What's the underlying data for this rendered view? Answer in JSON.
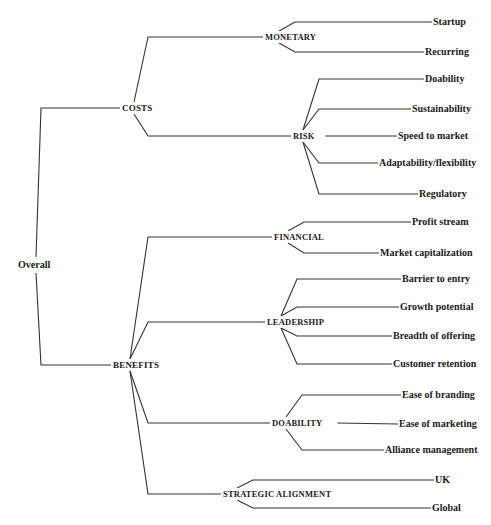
{
  "diagram": {
    "type": "hierarchy-tree",
    "line_color": "#333333",
    "root": {
      "label": "Overall",
      "x": 18,
      "y": 265,
      "children": [
        {
          "label": "COSTS",
          "x": 122,
          "y": 108,
          "children": [
            {
              "label": "MONETARY",
              "x": 265,
              "y": 37,
              "children": [
                {
                  "label": "Startup",
                  "x": 433,
                  "y": 22
                },
                {
                  "label": "Recurring",
                  "x": 425,
                  "y": 52
                }
              ]
            },
            {
              "label": "RISK",
              "x": 293,
              "y": 136,
              "children": [
                {
                  "label": "Doability",
                  "x": 425,
                  "y": 79
                },
                {
                  "label": "Sustainability",
                  "x": 412,
                  "y": 109
                },
                {
                  "label": "Speed to market",
                  "x": 398,
                  "y": 136
                },
                {
                  "label": "Adaptability/flexibility",
                  "x": 379,
                  "y": 163
                },
                {
                  "label": "Regulatory",
                  "x": 419,
                  "y": 194
                }
              ]
            }
          ]
        },
        {
          "label": "BENEFITS",
          "x": 113,
          "y": 365,
          "children": [
            {
              "label": "FINANCIAL",
              "x": 274,
              "y": 237,
              "children": [
                {
                  "label": "Profit stream",
                  "x": 412,
                  "y": 222
                },
                {
                  "label": "Market capitalization",
                  "x": 380,
                  "y": 253
                }
              ]
            },
            {
              "label": "LEADERSHIP",
              "x": 267,
              "y": 322,
              "children": [
                {
                  "label": "Barrier to entry",
                  "x": 402,
                  "y": 279
                },
                {
                  "label": "Growth potential",
                  "x": 400,
                  "y": 307
                },
                {
                  "label": "Breadth of offering",
                  "x": 393,
                  "y": 336
                },
                {
                  "label": "Customer retention",
                  "x": 393,
                  "y": 364
                }
              ]
            },
            {
              "label": "DOABILITY",
              "x": 272,
              "y": 423,
              "children": [
                {
                  "label": "Ease of branding",
                  "x": 402,
                  "y": 395
                },
                {
                  "label": "Ease of marketing",
                  "x": 399,
                  "y": 424
                },
                {
                  "label": "Alliance management",
                  "x": 385,
                  "y": 450
                }
              ]
            },
            {
              "label": "STRATEGIC ALIGNMENT",
              "x": 223,
              "y": 494,
              "children": [
                {
                  "label": "UK",
                  "x": 435,
                  "y": 480
                },
                {
                  "label": "Global",
                  "x": 432,
                  "y": 508
                }
              ]
            }
          ]
        }
      ]
    }
  }
}
